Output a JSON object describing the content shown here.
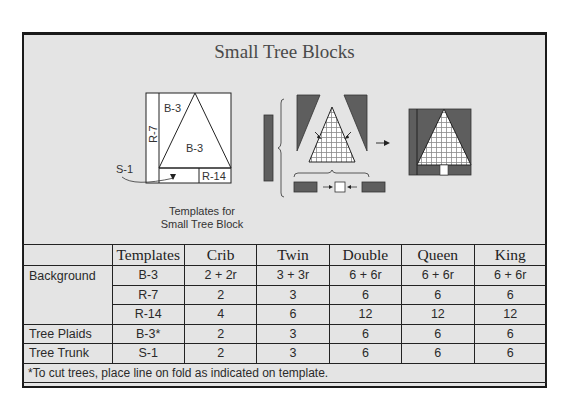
{
  "title": "Small Tree Blocks",
  "diagram": {
    "template_labels": {
      "top_left": "B-3",
      "center": "B-3",
      "side_strip": "R-7",
      "bottom_strip": "R-14",
      "trunk_pointer": "S-1"
    },
    "caption_line1": "Templates for",
    "caption_line2": "Small Tree Block",
    "colors": {
      "dark_fabric": "#5e5e5e",
      "plaid_fill": "#ffffff",
      "plaid_lines": "#8a8a8a",
      "outline": "#222222"
    }
  },
  "table": {
    "headers": [
      "",
      "Templates",
      "Crib",
      "Twin",
      "Double",
      "Queen",
      "King"
    ],
    "rows": [
      {
        "label": "Background",
        "template": "B-3",
        "values": [
          "2 + 2r",
          "3 + 3r",
          "6 + 6r",
          "6 + 6r",
          "6 + 6r"
        ]
      },
      {
        "label": "",
        "template": "R-7",
        "values": [
          "2",
          "3",
          "6",
          "6",
          "6"
        ]
      },
      {
        "label": "",
        "template": "R-14",
        "values": [
          "4",
          "6",
          "12",
          "12",
          "12"
        ]
      },
      {
        "label": "Tree Plaids",
        "template": "B-3*",
        "values": [
          "2",
          "3",
          "6",
          "6",
          "6"
        ]
      },
      {
        "label": "Tree Trunk",
        "template": "S-1",
        "values": [
          "2",
          "3",
          "6",
          "6",
          "6"
        ]
      }
    ],
    "footnote": "*To cut trees, place line on fold as indicated on template."
  }
}
